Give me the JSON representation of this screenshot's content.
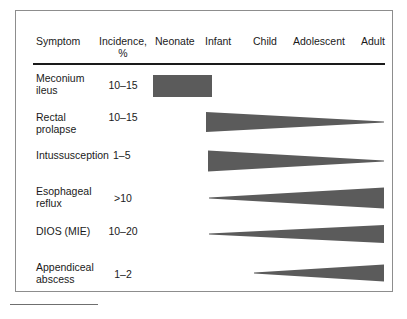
{
  "figure": {
    "columns": [
      {
        "id": "symptom",
        "label": "Symptom"
      },
      {
        "id": "incidence",
        "label": "Incidence,",
        "unit": "%"
      },
      {
        "id": "neonate",
        "label": "Neonate"
      },
      {
        "id": "infant",
        "label": "Infant"
      },
      {
        "id": "child",
        "label": "Child"
      },
      {
        "id": "adolescent",
        "label": "Adolescent"
      },
      {
        "id": "adult",
        "label": "Adult"
      }
    ],
    "rows": [
      {
        "symptom": "Meconium\nileus",
        "incidence": "10–15"
      },
      {
        "symptom": "Rectal\nprolapse",
        "incidence": "10–15"
      },
      {
        "symptom": "Intussusception",
        "incidence": "1–5"
      },
      {
        "symptom": "Esophageal\nreflux",
        "incidence": ">10"
      },
      {
        "symptom": "DIOS (MIE)",
        "incidence": "10–20"
      },
      {
        "symptom": "Appendiceal\nabscess",
        "incidence": "1–2"
      }
    ],
    "shape_fill": "#5b5b5b",
    "rule_color": "#1a1a1a",
    "frame_color": "#8d8d8d"
  },
  "chart_data": {
    "type": "bar",
    "title": "",
    "xlabel": "",
    "ylabel": "",
    "categories": [
      "Neonate",
      "Infant",
      "Child",
      "Adolescent",
      "Adult"
    ],
    "age_axis_px": {
      "Neonate": 152,
      "Infant": 205,
      "Child": 253,
      "Adolescent": 292,
      "Adult": 355,
      "end": 383
    },
    "grid": false,
    "legend": "none",
    "series": [
      {
        "name": "Meconium ileus",
        "incidence_percent": "10-15",
        "shape": "rectangle",
        "age_span": [
          "Neonate",
          "Infant"
        ],
        "x_start_px": 152,
        "x_end_px": 211,
        "thickness_start": 22,
        "thickness_end": 22
      },
      {
        "name": "Rectal prolapse",
        "incidence_percent": "10-15",
        "shape": "taper-right",
        "age_span": [
          "Infant",
          "Adult"
        ],
        "x_start_px": 205,
        "x_end_px": 383,
        "thickness_start": 20,
        "thickness_end": 1
      },
      {
        "name": "Intussusception",
        "incidence_percent": "1-5",
        "shape": "taper-right",
        "age_span": [
          "Infant",
          "Adult"
        ],
        "x_start_px": 207,
        "x_end_px": 383,
        "thickness_start": 21,
        "thickness_end": 1
      },
      {
        "name": "Esophageal reflux",
        "incidence_percent": ">10",
        "shape": "taper-left",
        "age_span": [
          "Infant",
          "Adult"
        ],
        "x_start_px": 208,
        "x_end_px": 383,
        "thickness_start": 1,
        "thickness_end": 21
      },
      {
        "name": "DIOS (MIE)",
        "incidence_percent": "10-20",
        "shape": "taper-left",
        "age_span": [
          "Infant",
          "Adult"
        ],
        "x_start_px": 208,
        "x_end_px": 383,
        "thickness_start": 1,
        "thickness_end": 18
      },
      {
        "name": "Appendiceal abscess",
        "incidence_percent": "1-2",
        "shape": "taper-left",
        "age_span": [
          "Child",
          "Adult"
        ],
        "x_start_px": 253,
        "x_end_px": 383,
        "thickness_start": 1,
        "thickness_end": 17
      }
    ]
  }
}
